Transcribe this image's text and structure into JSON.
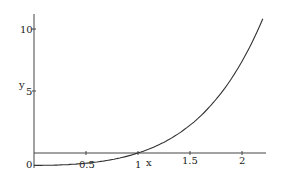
{
  "chart_data": {
    "type": "line",
    "title": "",
    "xlabel": "x",
    "ylabel": "y",
    "xlim": [
      0,
      2.2
    ],
    "ylim": [
      -1,
      11
    ],
    "grid": false,
    "legend": null,
    "x_ticks": [
      "0",
      "0.5",
      "1",
      "1.5",
      "2"
    ],
    "y_ticks": [
      "5",
      "10"
    ],
    "series": [
      {
        "name": "y = (x-1)e^x",
        "x": [
          0,
          0.25,
          0.5,
          0.75,
          1.0,
          1.25,
          1.5,
          1.75,
          2.0,
          2.2
        ],
        "y": [
          -1.0,
          -0.96,
          -0.82,
          -0.53,
          0.0,
          0.87,
          2.24,
          4.31,
          7.39,
          10.83
        ]
      }
    ]
  },
  "labels": {
    "x_axis": "x",
    "y_axis": "y",
    "origin": "0",
    "xt_05": "0.5",
    "xt_1": "1",
    "xt_15": "1.5",
    "xt_2": "2",
    "yt_5": "5",
    "yt_10": "10"
  },
  "colors": {
    "line": "#333333",
    "axis": "#444444"
  }
}
